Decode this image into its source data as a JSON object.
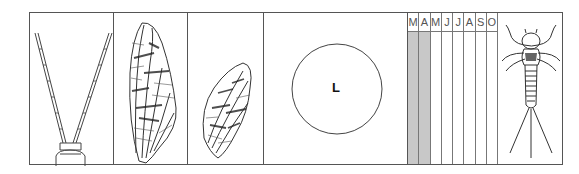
{
  "figure": {
    "panels": [
      {
        "id": "tails",
        "description": "two long segmented cerci (tails) from abdomen tip"
      },
      {
        "id": "forewing",
        "description": "mottled forewing with dark cross-veins"
      },
      {
        "id": "hindwing",
        "description": "mottled hindwing"
      },
      {
        "id": "size",
        "description": "size indicator circle",
        "label": "L"
      },
      {
        "id": "season",
        "description": "flight season calendar"
      },
      {
        "id": "nymph",
        "description": "nymph with three tails"
      }
    ],
    "size_label": "L",
    "months": [
      "M",
      "A",
      "M",
      "J",
      "J",
      "A",
      "S",
      "O"
    ],
    "shaded_months": [
      true,
      true,
      false,
      false,
      false,
      false,
      false,
      false
    ],
    "colors": {
      "line": "#555555",
      "shade": "#c8c8c8"
    }
  }
}
